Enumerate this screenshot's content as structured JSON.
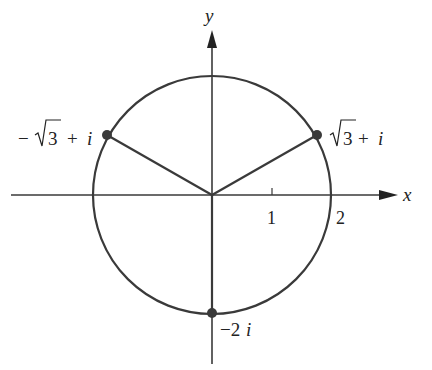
{
  "figure": {
    "axes": {
      "x_label": "x",
      "y_label": "y",
      "ticks": [
        {
          "value": 1,
          "label": "1"
        },
        {
          "value": 2,
          "label": "2"
        }
      ]
    },
    "circle": {
      "center": [
        0,
        0
      ],
      "radius": 2
    },
    "points": [
      {
        "id": "p1",
        "re": 1.732,
        "im": 1,
        "label_root": "3",
        "label_prefix": "",
        "label_suffix": "+ i",
        "label_minus": ""
      },
      {
        "id": "p2",
        "re": -1.732,
        "im": 1,
        "label_root": "3",
        "label_prefix": "",
        "label_suffix": "+ i",
        "label_minus": "−"
      },
      {
        "id": "p3",
        "re": 0,
        "im": -2,
        "label": "−2i",
        "label_num": "−2",
        "label_var": "i"
      }
    ],
    "colors": {
      "stroke": "#3a3a3a",
      "point": "#3a3a3a",
      "text": "#222222",
      "background": "#ffffff"
    }
  }
}
